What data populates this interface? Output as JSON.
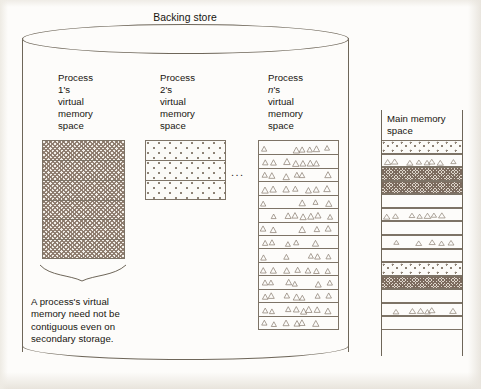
{
  "figure": {
    "title": "Backing store",
    "caption": "A process's virtual\nmemory need not be\ncontiguous even on\nsecondary storage.",
    "ellipsis": "...",
    "colors": {
      "background": "#fdfcfa",
      "outline": "#6e6659",
      "block_border": "#7d7366",
      "pattern_dark": "#78675a",
      "pattern_mid": "#8a786a",
      "pattern_light": "#8d8275",
      "text": "#17150f"
    }
  },
  "processes": [
    {
      "label": "Process\n1's\nvirtual\nmemory\nspace",
      "name": "process-1",
      "pattern": "dense-crosshatch",
      "rows": 6
    },
    {
      "label": "Process\n2's\nvirtual\nmemory\nspace",
      "name": "process-2",
      "pattern": "sparse-dots",
      "rows": 3
    },
    {
      "label": "Process\nn's\nvirtual\nmemory\nspace",
      "name": "process-n",
      "pattern": "triangles",
      "rows": 14
    }
  ],
  "main_memory": {
    "label": "Main memory\nspace",
    "blocks": [
      {
        "pattern": "sparse-dots",
        "owner": "process-2"
      },
      {
        "pattern": "triangles",
        "owner": "process-n"
      },
      {
        "pattern": "dense-crosshatch",
        "owner": "process-1"
      },
      {
        "pattern": "dense-crosshatch",
        "owner": "process-1"
      },
      {
        "pattern": "empty",
        "owner": "free"
      },
      {
        "pattern": "triangles",
        "owner": "process-n"
      },
      {
        "pattern": "empty",
        "owner": "free"
      },
      {
        "pattern": "triangles",
        "owner": "process-n"
      },
      {
        "pattern": "empty",
        "owner": "free"
      },
      {
        "pattern": "sparse-dots",
        "owner": "process-2"
      },
      {
        "pattern": "dense-crosshatch",
        "owner": "process-1"
      },
      {
        "pattern": "empty",
        "owner": "free"
      },
      {
        "pattern": "triangles",
        "owner": "process-n"
      },
      {
        "pattern": "empty",
        "owner": "free"
      }
    ]
  }
}
